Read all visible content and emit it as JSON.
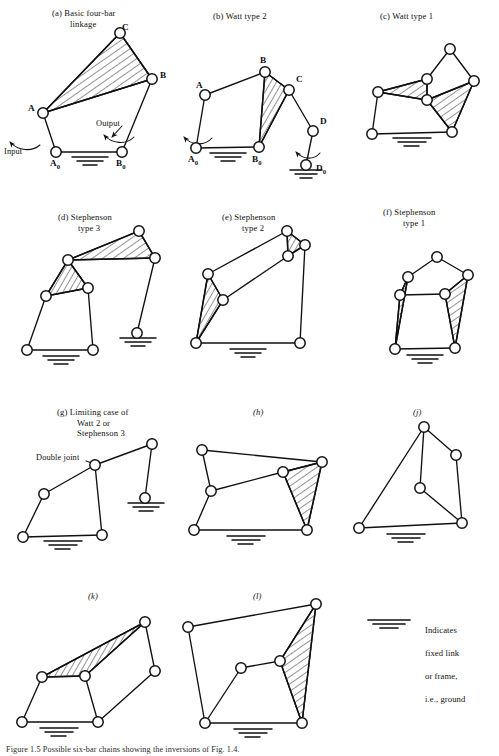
{
  "figure": {
    "caption": "Figure 1.5 Possible six-bar chains showing the inversions of Fig. 1.4.",
    "background_color": "#ffffff",
    "ink_color": "#101010",
    "legend": {
      "icon": "ground-hatch-icon",
      "lines": [
        "Indicates",
        "fixed link",
        "or frame,",
        "i.e., ground"
      ]
    }
  },
  "panels": [
    {
      "id": "a",
      "tag": "(a)",
      "title_lines": [
        "Basic four-bar",
        "linkage"
      ],
      "title_x": 52,
      "title_y": 8,
      "node_labels": [
        {
          "text": "C",
          "x": 122,
          "y": 22
        },
        {
          "text": "B",
          "x": 155,
          "y": 70
        },
        {
          "text": "A",
          "x": 23,
          "y": 110
        },
        {
          "text": "A",
          "sub": "0",
          "x": 52,
          "y": 163
        },
        {
          "text": "B",
          "sub": "0",
          "x": 120,
          "y": 163
        }
      ],
      "annotations": [
        {
          "text": "Input",
          "x": 6,
          "y": 148
        },
        {
          "text": "Output",
          "x": 92,
          "y": 128
        }
      ]
    },
    {
      "id": "b",
      "tag": "(b)",
      "title_lines": [
        "Watt type 2"
      ],
      "title_x": 215,
      "title_y": 12,
      "node_labels": [
        {
          "text": "B",
          "x": 258,
          "y": 58
        },
        {
          "text": "C",
          "x": 289,
          "y": 78
        },
        {
          "text": "A",
          "x": 190,
          "y": 84
        },
        {
          "text": "D",
          "x": 320,
          "y": 120
        },
        {
          "text": "A",
          "sub": "0",
          "x": 182,
          "y": 152
        },
        {
          "text": "B",
          "sub": "0",
          "x": 252,
          "y": 152
        },
        {
          "text": "D",
          "sub": "0",
          "x": 315,
          "y": 169
        }
      ],
      "annotations": []
    },
    {
      "id": "c",
      "tag": "(c)",
      "title_lines": [
        "Watt type 1"
      ],
      "title_x": 380,
      "title_y": 12,
      "node_labels": [],
      "annotations": []
    },
    {
      "id": "d",
      "tag": "(d)",
      "title_lines": [
        "Stephenson",
        "type 3"
      ],
      "title_x": 58,
      "title_y": 213,
      "node_labels": [],
      "annotations": []
    },
    {
      "id": "e",
      "tag": "(e)",
      "title_lines": [
        "Stephenson",
        "type 2"
      ],
      "title_x": 222,
      "title_y": 213,
      "node_labels": [],
      "annotations": []
    },
    {
      "id": "f",
      "tag": "(f)",
      "title_lines": [
        "Stephenson",
        "type 1"
      ],
      "title_x": 383,
      "title_y": 208,
      "node_labels": [],
      "annotations": []
    },
    {
      "id": "g",
      "tag": "(g)",
      "title_lines": [
        "Limiting case of",
        "Watt 2 or",
        "Stephenson 3"
      ],
      "title_x": 57,
      "title_y": 408,
      "node_labels": [],
      "annotations": [
        {
          "text": "Double joint",
          "x": 38,
          "y": 457
        }
      ]
    },
    {
      "id": "h",
      "tag": "(h)",
      "title_lines": [],
      "title_x": 253,
      "title_y": 408,
      "node_labels": [],
      "annotations": []
    },
    {
      "id": "j",
      "tag": "(j)",
      "title_lines": [],
      "title_x": 413,
      "title_y": 408,
      "node_labels": [],
      "annotations": []
    },
    {
      "id": "k",
      "tag": "(k)",
      "title_lines": [],
      "title_x": 88,
      "title_y": 592,
      "node_labels": [],
      "annotations": []
    },
    {
      "id": "l",
      "tag": "(l)",
      "title_lines": [],
      "title_x": 253,
      "title_y": 592,
      "node_labels": [],
      "annotations": []
    }
  ]
}
